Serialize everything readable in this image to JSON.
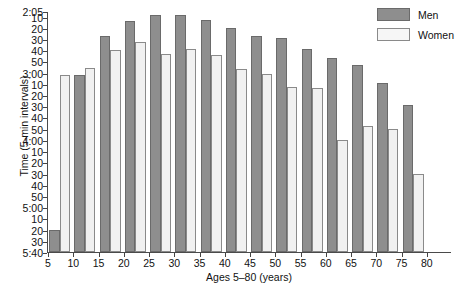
{
  "chart_data": {
    "type": "bar",
    "title": "",
    "xlabel": "Ages 5–80 (years)",
    "ylabel": "Time (5-min intervals)",
    "categories": [
      "5",
      "10",
      "15",
      "20",
      "25",
      "30",
      "35",
      "40",
      "45",
      "50",
      "55",
      "60",
      "65",
      "70",
      "75",
      "80"
    ],
    "xtick_labels": [
      "5",
      "10",
      "15",
      "20",
      "25",
      "30",
      "35",
      "40",
      "45",
      "50",
      "55",
      "60",
      "65",
      "70",
      "75",
      "80"
    ],
    "ytick_labels": [
      "2:05",
      "10",
      "20",
      "30",
      "40",
      "50",
      "3:00",
      "10",
      "20",
      "30",
      "40",
      "50",
      "4:00",
      "10",
      "20",
      "30",
      "40",
      "50",
      "5:00",
      "10",
      "20",
      "30",
      "5:40"
    ],
    "ytick_minutes": [
      125,
      130,
      140,
      150,
      160,
      170,
      180,
      190,
      200,
      210,
      220,
      230,
      240,
      250,
      260,
      270,
      280,
      290,
      300,
      310,
      320,
      330,
      340
    ],
    "ylim_minutes": [
      125,
      340
    ],
    "y_axis_inverted": true,
    "grid": false,
    "legend_position": "top-right",
    "series": [
      {
        "name": "Men",
        "color": "#8e8e8e",
        "values": [
          "5:20",
          "3:02",
          "2:27",
          "2:14",
          "2:09",
          "2:09",
          "2:13",
          "2:20",
          "2:27",
          "2:29",
          "2:39",
          "2:47",
          "2:53",
          "3:09",
          "3:29",
          ""
        ],
        "values_minutes": [
          320,
          182,
          147,
          134,
          129,
          129,
          133,
          140,
          147,
          149,
          159,
          167,
          173,
          189,
          209,
          null
        ]
      },
      {
        "name": "Women",
        "color": "#f1f1f1",
        "values": [
          "3:02",
          "2:56",
          "2:40",
          "2:33",
          "2:43",
          "2:39",
          "2:44",
          "2:57",
          "3:01",
          "3:13",
          "3:14",
          "4:00",
          "3:48",
          "3:50",
          "4:30",
          ""
        ],
        "values_minutes": [
          182,
          176,
          160,
          153,
          163,
          159,
          164,
          177,
          181,
          193,
          194,
          240,
          228,
          230,
          270,
          null
        ]
      }
    ]
  },
  "legend": {
    "items": [
      {
        "label": "Men"
      },
      {
        "label": "Women"
      }
    ]
  }
}
